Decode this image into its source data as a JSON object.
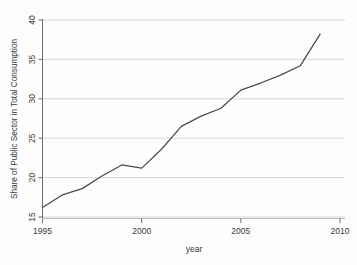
{
  "chart_data": {
    "type": "line",
    "title": "",
    "xlabel": "year",
    "ylabel": "Share of Public Sector in Total Consumption",
    "xlim": [
      1995,
      2010
    ],
    "ylim": [
      15,
      40
    ],
    "grid": "horizontal",
    "legend": "none",
    "xticks": [
      "1995",
      "2000",
      "2005",
      "2010"
    ],
    "xtick_values": [
      1995,
      2000,
      2005,
      2010
    ],
    "yticks": [
      "15",
      "20",
      "25",
      "30",
      "35",
      "40"
    ],
    "ytick_values": [
      15,
      20,
      25,
      30,
      35,
      40
    ],
    "x": [
      1995,
      1996,
      1997,
      1998,
      1999,
      2000,
      2001,
      2002,
      2003,
      2004,
      2005,
      2006,
      2007,
      2008,
      2009
    ],
    "series": [
      {
        "name": "Share of Public Sector in Total Consumption",
        "color": "#4a4a4a",
        "values": [
          16.2,
          17.8,
          18.6,
          20.2,
          21.6,
          21.2,
          23.6,
          26.5,
          27.8,
          28.8,
          31.1,
          32.0,
          33.0,
          34.2,
          38.2
        ]
      }
    ],
    "line_color": "#4a4a4a",
    "grid_color": "#d8d8d8",
    "axis_color": "#6f6f6f"
  }
}
